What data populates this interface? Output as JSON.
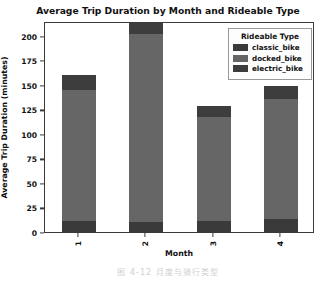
{
  "chart_data": {
    "type": "bar",
    "subtype": "stacked-vertical",
    "title": "Average Trip Duration by Month and Rideable Type",
    "xlabel": "Month",
    "ylabel": "Average Trip Duration (minutes)",
    "categories": [
      "1",
      "2",
      "3",
      "4"
    ],
    "ylim": [
      0,
      215
    ],
    "yticks": [
      0,
      25,
      50,
      75,
      100,
      125,
      150,
      175,
      200
    ],
    "ytick_labels": [
      "0",
      "25",
      "50",
      "75",
      "100",
      "125",
      "150",
      "175",
      "200"
    ],
    "grid": false,
    "legend_position": "upper right",
    "legend_title": "Rideable Type",
    "series": [
      {
        "name": "classic_bike",
        "color": "#3a3a3a",
        "values": [
          11,
          10,
          11,
          13
        ]
      },
      {
        "name": "docked_bike",
        "color": "#666666",
        "values": [
          134,
          192,
          106,
          123
        ]
      },
      {
        "name": "electric_bike",
        "color": "#3d3d3d",
        "values": [
          15,
          11,
          11,
          13
        ]
      }
    ],
    "totals": [
      160,
      213,
      128,
      149
    ],
    "bar_width_fraction": 0.5,
    "xtick_label_rotation": 90
  },
  "caption": {
    "text": "图 4-12  月度与骑行类型"
  }
}
